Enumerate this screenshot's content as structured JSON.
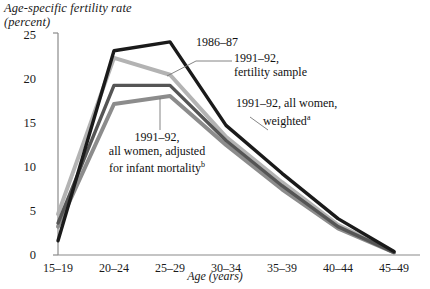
{
  "chart_data": {
    "type": "line",
    "ylabel": "Age-specific fertility rate (percent)",
    "xlabel": "Age (years)",
    "categories": [
      "15–19",
      "20–24",
      "25–29",
      "30–34",
      "35–39",
      "40–44",
      "45–49"
    ],
    "yticks": [
      0,
      5,
      10,
      15,
      20,
      25
    ],
    "ylim": [
      0,
      25
    ],
    "grid": false,
    "legend": "inline annotations",
    "series": [
      {
        "name": "1986–87",
        "color": "#1a1a1a",
        "values": [
          1.6,
          23.0,
          24.0,
          14.6,
          9.2,
          4.1,
          0.4
        ]
      },
      {
        "name": "1991–92, fertility sample",
        "color": "#b3b3b3",
        "values": [
          4.6,
          22.2,
          20.3,
          13.3,
          8.2,
          3.4,
          0.3
        ]
      },
      {
        "name": "1991–92, all women, weighted",
        "color": "#555555",
        "values": [
          3.6,
          19.1,
          19.1,
          12.9,
          7.8,
          3.2,
          0.3
        ]
      },
      {
        "name": "1991–92, all women, adjusted for infant mortality",
        "color": "#8c8c8c",
        "values": [
          3.2,
          17.0,
          17.9,
          12.4,
          7.4,
          3.0,
          0.3
        ]
      }
    ]
  },
  "axis": {
    "y_title_line1": "Age-specific fertility rate",
    "y_title_line2": "(percent)",
    "x_title": "Age (years)",
    "yticks": [
      "25",
      "20",
      "15",
      "10",
      "5",
      "0"
    ],
    "xticks": [
      "15–19",
      "20–24",
      "25–29",
      "30–34",
      "35–39",
      "40–44",
      "45–49"
    ]
  },
  "annotations": {
    "a1986_87": "1986–87",
    "a1991_92_fertility_line1": "1991–92,",
    "a1991_92_fertility_line2": "fertility sample",
    "a1991_92_weighted_line1": "1991–92, all women,",
    "a1991_92_weighted_line2": "weighted",
    "a1991_92_weighted_sup": "a",
    "a1991_92_adjusted_line1": "1991–92,",
    "a1991_92_adjusted_line2": "all women, adjusted",
    "a1991_92_adjusted_line3": "for infant mortality",
    "a1991_92_adjusted_sup": "b"
  },
  "colors": {
    "series_1986": "#1a1a1a",
    "series_fertility_sample": "#b3b3b3",
    "series_weighted": "#555555",
    "series_adjusted": "#8c8c8c",
    "axis": "#8a8a8a"
  }
}
